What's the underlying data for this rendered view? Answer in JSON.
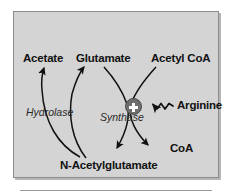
{
  "diagram": {
    "type": "biochemical-pathway-cycle",
    "panel": {
      "background_color": "#d4d4d4",
      "border_color": "#8d8d8d"
    },
    "nodes": [
      {
        "id": "acetate",
        "label": "Acetate",
        "role": "metabolite"
      },
      {
        "id": "glutamate",
        "label": "Glutamate",
        "role": "metabolite"
      },
      {
        "id": "acetyl-coa",
        "label": "Acetyl CoA",
        "role": "metabolite"
      },
      {
        "id": "arginine",
        "label": "Arginine",
        "role": "activator"
      },
      {
        "id": "coa",
        "label": "CoA",
        "role": "metabolite"
      },
      {
        "id": "n-acetylglutamate",
        "label": "N-Acetylglutamate",
        "role": "metabolite"
      }
    ],
    "enzymes": [
      {
        "id": "hydrolase",
        "label": "Hydrolase",
        "style": "italic"
      },
      {
        "id": "synthase",
        "label": "Synthase",
        "style": "italic"
      }
    ],
    "regulation": {
      "sign": "+",
      "badge_label": "+",
      "badge_color": "#6e6e6e",
      "badge_symbol_color": "#ffffff",
      "effector": "Arginine",
      "target_enzyme": "Synthase",
      "connector": "wavy-arrow"
    },
    "reactions": [
      {
        "id": "synthesis",
        "enzyme": "Synthase",
        "substrates": [
          "Glutamate",
          "Acetyl CoA"
        ],
        "products": [
          "N-Acetylglutamate",
          "CoA"
        ]
      },
      {
        "id": "hydrolysis",
        "enzyme": "Hydrolase",
        "substrates": [
          "N-Acetylglutamate"
        ],
        "products": [
          "Acetate",
          "Glutamate"
        ]
      }
    ]
  }
}
